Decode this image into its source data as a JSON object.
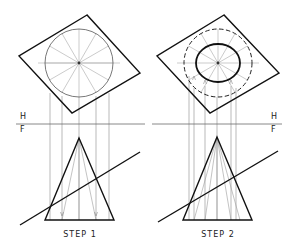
{
  "figure": {
    "colors": {
      "object_line": "#111111",
      "construction_line": "#9a9a9a",
      "projector_line": "#8a8a8a",
      "fold_line": "#6a6a6a",
      "text": "#222222"
    },
    "fold_line_labels": {
      "horizontal": "H",
      "frontal": "F"
    },
    "panels": [
      {
        "id": "step-1",
        "caption": "STEP 1",
        "top_view": {
          "plane_outline": [
            [
              87,
              15
            ],
            [
              19,
              56
            ],
            [
              72,
              113
            ],
            [
              140,
              73
            ]
          ],
          "cone_base_circle": {
            "cx": 79,
            "cy": 63,
            "r": 34,
            "style": "thin"
          },
          "radial_elements": 12,
          "center_mark": [
            79,
            63
          ]
        },
        "front_view": {
          "cone": {
            "apex": [
              79,
              138
            ],
            "base_left": [
              45,
              220
            ],
            "base_right": [
              114,
              220
            ]
          },
          "cutting_plane_edge": [
            [
              20,
              225
            ],
            [
              140,
              152
            ]
          ]
        },
        "projectors_x": [
          50,
          62,
          96,
          109
        ],
        "fold_line": {
          "x1": 16,
          "x2": 145,
          "y": 124
        },
        "label_positions": {
          "H": [
            20,
            113
          ],
          "F": [
            20,
            126
          ],
          "caption": [
            80,
            231
          ]
        }
      },
      {
        "id": "step-2",
        "caption": "STEP 2",
        "top_view": {
          "plane_outline": [
            [
              224,
              15
            ],
            [
              157,
              56
            ],
            [
              210,
              113
            ],
            [
              279,
              73
            ]
          ],
          "cone_base_circle": {
            "cx": 218,
            "cy": 63,
            "r": 34,
            "style": "dashed"
          },
          "intersection_curve": {
            "cx": 218,
            "cy": 63,
            "rx": 22,
            "ry": 19,
            "style": "bold"
          },
          "radial_elements": 12,
          "center_mark": [
            218,
            63
          ]
        },
        "front_view": {
          "cone": {
            "apex": [
              217,
              137
            ],
            "base_left": [
              183,
              220
            ],
            "base_right": [
              252,
              220
            ]
          },
          "cutting_plane_edge": [
            [
              158,
              222
            ],
            [
              278,
              151
            ]
          ]
        },
        "projectors_x": [
          189,
          196,
          205,
          226,
          233,
          239
        ],
        "fold_line": {
          "x1": 152,
          "x2": 282,
          "y": 124
        },
        "label_positions": {
          "H": [
            271,
            113
          ],
          "F": [
            271,
            126
          ],
          "caption": [
            218,
            231
          ]
        }
      }
    ]
  }
}
